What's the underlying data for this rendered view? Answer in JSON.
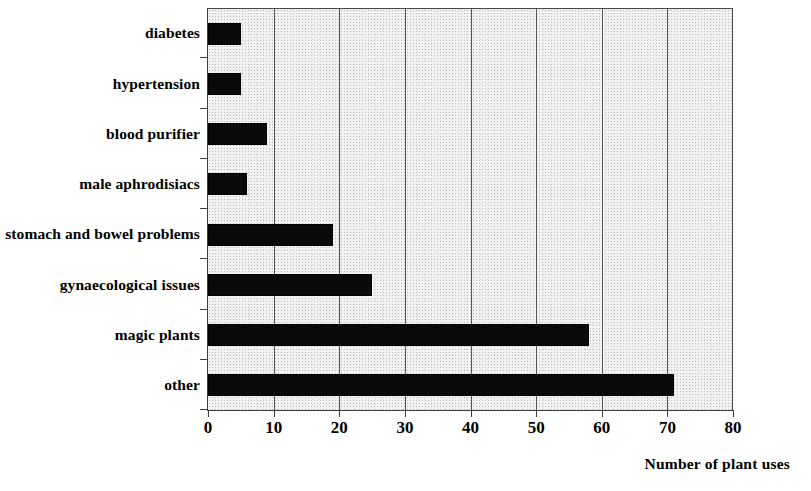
{
  "chart_data": {
    "type": "bar",
    "orientation": "horizontal",
    "title": "",
    "subtitle": "",
    "xlabel": "Number of plant uses",
    "ylabel": "",
    "xlim": [
      0,
      80
    ],
    "xticks": [
      0,
      10,
      20,
      30,
      40,
      50,
      60,
      70,
      80
    ],
    "xtick_labels": [
      "0",
      "10",
      "20",
      "30",
      "40",
      "50",
      "60",
      "70",
      "80"
    ],
    "grid": "vertical",
    "legend": "none",
    "categories": [
      "diabetes",
      "hypertension",
      "blood purifier",
      "male aphrodisiacs",
      "stomach and bowel problems",
      "gynaecological issues",
      "magic plants",
      "other"
    ],
    "values": [
      5,
      5,
      9,
      6,
      19,
      25,
      58,
      71
    ],
    "bar_color": "#0a0a0a",
    "plot_background": "#f2f2f2",
    "gridline_color": "#555555",
    "axis_color": "#3d3d3d"
  },
  "axis_title": {
    "text": "Number of plant uses"
  }
}
